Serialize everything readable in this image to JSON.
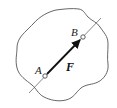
{
  "diagram": {
    "type": "force-on-rigid-body",
    "colors": {
      "background": "#ffffff",
      "outline": "#555555",
      "line_of_action": "#555555",
      "force_vector": "#111111",
      "point_fill": "#ffffff"
    },
    "body": {
      "shape": "irregular-closed-curve"
    },
    "line_of_action": {
      "start": [
        29,
        93
      ],
      "end": [
        101,
        18
      ]
    },
    "points": [
      {
        "id": "A",
        "label": "A",
        "x": 45,
        "y": 76,
        "label_x": 35,
        "label_y": 74
      },
      {
        "id": "B",
        "label": "B",
        "x": 83,
        "y": 37,
        "label_x": 71,
        "label_y": 36
      }
    ],
    "force": {
      "label": "F",
      "from": "A",
      "to": "B",
      "label_x": 66,
      "label_y": 71
    }
  }
}
